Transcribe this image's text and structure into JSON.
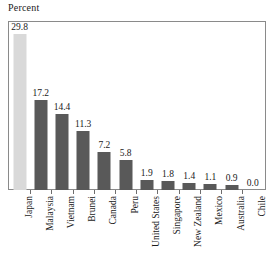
{
  "chart_data": {
    "type": "bar",
    "title": "Percent",
    "xlabel": "",
    "ylabel": "Percent",
    "ylim": [
      0,
      32
    ],
    "grid": false,
    "legend": "none",
    "categories": [
      "Japan",
      "Malaysia",
      "Vietnam",
      "Brunei",
      "Canada",
      "Peru",
      "United States",
      "Singapore",
      "New Zealand",
      "Mexico",
      "Australia",
      "Chile"
    ],
    "values": [
      29.8,
      17.2,
      14.4,
      11.3,
      7.2,
      5.8,
      1.9,
      1.8,
      1.4,
      1.1,
      0.9,
      0.0
    ],
    "value_labels": [
      "29.8",
      "17.2",
      "14.4",
      "11.3",
      "7.2",
      "5.8",
      "1.9",
      "1.8",
      "1.4",
      "1.1",
      "0.9",
      "0.0"
    ],
    "highlight_index": 0,
    "colors": {
      "bar": "#595959",
      "highlight_bar": "#d9d9d9",
      "frame": "#8a8a8a",
      "text": "#1a1a1a",
      "background": "#ffffff"
    }
  }
}
